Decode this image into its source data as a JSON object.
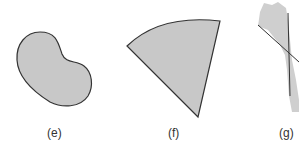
{
  "figures": [
    {
      "id": "e",
      "label": "(e)",
      "shape": "kidney-shaped region"
    },
    {
      "id": "f",
      "label": "(f)",
      "shape": "circular sector"
    },
    {
      "id": "g",
      "label": "(g)",
      "shape": "irregular strip crossed by two lines"
    }
  ],
  "colors": {
    "fill": "#c8c8c8",
    "stroke": "#333333",
    "background": "#ffffff"
  }
}
